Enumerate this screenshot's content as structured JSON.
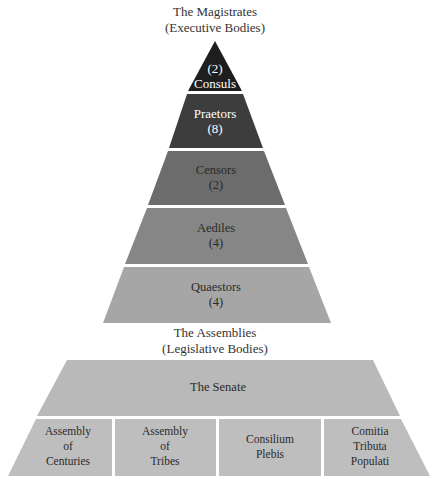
{
  "magistrates_heading": {
    "line1": "The Magistrates",
    "line2": "(Executive Bodies)"
  },
  "assemblies_heading": {
    "line1": "The Assemblies",
    "line2": "(Legislative Bodies)"
  },
  "pyramid": [
    {
      "name": "Consuls",
      "label": "(2)\nConsuls",
      "count": 2,
      "color": "#1e1e1e",
      "text_color": "#ffffff"
    },
    {
      "name": "Praetors",
      "label": "Praetors\n(8)",
      "count": 8,
      "color": "#3d3d3d",
      "text_color": "#ffffff"
    },
    {
      "name": "Censors",
      "label": "Censors\n(2)",
      "count": 2,
      "color": "#6c6c6c",
      "text_color": "#2a2a2a"
    },
    {
      "name": "Aediles",
      "label": "Aediles\n(4)",
      "count": 4,
      "color": "#868686",
      "text_color": "#2a2a2a"
    },
    {
      "name": "Quaestors",
      "label": "Quaestors\n(4)",
      "count": 4,
      "color": "#a6a6a6",
      "text_color": "#2a2a2a"
    }
  ],
  "senate": {
    "label": "The Senate",
    "color": "#b9b9b9"
  },
  "assemblies": [
    {
      "label": "Assembly\nof\nCenturies"
    },
    {
      "label": "Assembly\nof\nTribes"
    },
    {
      "label": "Consilium\nPlebis"
    },
    {
      "label": "Comitia\nTributa\nPopulati"
    }
  ],
  "assemblies_color": "#bebebe"
}
